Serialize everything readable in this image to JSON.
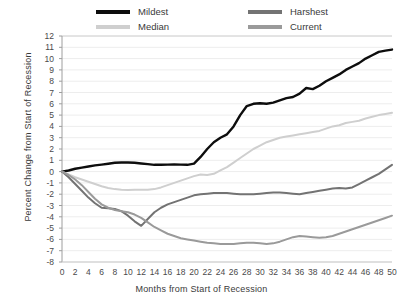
{
  "chart_data": {
    "type": "line",
    "title": "",
    "xlabel": "Months from Start of Recession",
    "ylabel": "Percent Change from Start of Recession",
    "xlim": [
      0,
      50
    ],
    "ylim": [
      -8,
      12
    ],
    "xticks": [
      0,
      2,
      4,
      6,
      8,
      10,
      12,
      14,
      16,
      18,
      20,
      22,
      24,
      26,
      28,
      30,
      32,
      34,
      36,
      38,
      40,
      42,
      44,
      46,
      48,
      50
    ],
    "yticks": [
      -8,
      -7,
      -6,
      -5,
      -4,
      -3,
      -2,
      -1,
      0,
      1,
      2,
      3,
      4,
      5,
      6,
      7,
      8,
      9,
      10,
      11,
      12
    ],
    "grid": "horizontal",
    "legend_position": "top",
    "x": [
      0,
      1,
      2,
      3,
      4,
      5,
      6,
      7,
      8,
      9,
      10,
      11,
      12,
      13,
      14,
      15,
      16,
      17,
      18,
      19,
      20,
      21,
      22,
      23,
      24,
      25,
      26,
      27,
      28,
      29,
      30,
      31,
      32,
      33,
      34,
      35,
      36,
      37,
      38,
      39,
      40,
      41,
      42,
      43,
      44,
      45,
      46,
      47,
      48,
      49,
      50
    ],
    "series": [
      {
        "name": "Mildest",
        "color": "#0d0d0d",
        "values": [
          0,
          0.1,
          0.25,
          0.35,
          0.45,
          0.55,
          0.62,
          0.7,
          0.78,
          0.8,
          0.8,
          0.78,
          0.72,
          0.66,
          0.6,
          0.6,
          0.62,
          0.64,
          0.62,
          0.6,
          0.7,
          1.3,
          2.0,
          2.6,
          3.0,
          3.3,
          4.0,
          5.0,
          5.8,
          6.0,
          6.05,
          6.0,
          6.1,
          6.3,
          6.5,
          6.6,
          6.9,
          7.4,
          7.3,
          7.6,
          8.0,
          8.3,
          8.6,
          9.0,
          9.3,
          9.6,
          10.0,
          10.3,
          10.6,
          10.7,
          10.8
        ]
      },
      {
        "name": "Median",
        "color": "#cfcfcf",
        "values": [
          0,
          -0.25,
          -0.5,
          -0.7,
          -0.9,
          -1.1,
          -1.3,
          -1.45,
          -1.55,
          -1.6,
          -1.62,
          -1.6,
          -1.6,
          -1.6,
          -1.55,
          -1.4,
          -1.2,
          -1.0,
          -0.8,
          -0.6,
          -0.4,
          -0.25,
          -0.3,
          -0.2,
          0.1,
          0.4,
          0.8,
          1.2,
          1.6,
          2.0,
          2.3,
          2.6,
          2.8,
          3.0,
          3.1,
          3.2,
          3.3,
          3.4,
          3.5,
          3.6,
          3.8,
          4.0,
          4.1,
          4.3,
          4.4,
          4.5,
          4.7,
          4.85,
          5.0,
          5.1,
          5.2
        ]
      },
      {
        "name": "Harshest",
        "color": "#737373",
        "values": [
          0,
          -0.5,
          -1.1,
          -1.7,
          -2.3,
          -2.8,
          -3.2,
          -3.25,
          -3.3,
          -3.5,
          -3.9,
          -4.4,
          -4.8,
          -4.2,
          -3.6,
          -3.2,
          -2.9,
          -2.7,
          -2.5,
          -2.3,
          -2.1,
          -2.0,
          -1.95,
          -1.9,
          -1.9,
          -1.9,
          -1.95,
          -2.0,
          -2.0,
          -2.0,
          -1.95,
          -1.9,
          -1.85,
          -1.85,
          -1.9,
          -1.95,
          -2.0,
          -1.9,
          -1.8,
          -1.7,
          -1.6,
          -1.5,
          -1.45,
          -1.5,
          -1.4,
          -1.1,
          -0.8,
          -0.5,
          -0.2,
          0.2,
          0.6
        ]
      },
      {
        "name": "Current",
        "color": "#9a9a9a",
        "values": [
          0,
          -0.3,
          -0.7,
          -1.2,
          -1.8,
          -2.4,
          -2.9,
          -3.2,
          -3.4,
          -3.5,
          -3.6,
          -3.8,
          -4.1,
          -4.5,
          -4.9,
          -5.2,
          -5.5,
          -5.7,
          -5.9,
          -6.0,
          -6.1,
          -6.2,
          -6.3,
          -6.35,
          -6.4,
          -6.4,
          -6.4,
          -6.35,
          -6.3,
          -6.3,
          -6.35,
          -6.4,
          -6.35,
          -6.2,
          -6.0,
          -5.8,
          -5.7,
          -5.75,
          -5.8,
          -5.85,
          -5.8,
          -5.7,
          -5.5,
          -5.3,
          -5.1,
          -4.9,
          -4.7,
          -4.5,
          -4.3,
          -4.1,
          -3.9
        ]
      }
    ]
  }
}
